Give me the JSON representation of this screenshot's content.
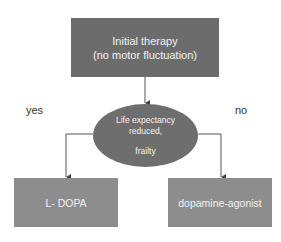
{
  "diagram": {
    "root": {
      "line1": "Initial therapy",
      "line2": "(no motor fluctuation)"
    },
    "decision": {
      "line1": "Life expectancy",
      "line2": "reduced,",
      "line3": "frailty"
    },
    "branches": {
      "yes_label": "yes",
      "no_label": "no"
    },
    "outcomes": {
      "yes": "L- DOPA",
      "no": "dopamine-agonist"
    },
    "colors": {
      "root_fill": "#6c6c6c",
      "decision_fill": "#6e6e6e",
      "outcome_fill": "#8d8d8d",
      "connector": "#555555",
      "node_text": "#f2f2f2"
    }
  }
}
